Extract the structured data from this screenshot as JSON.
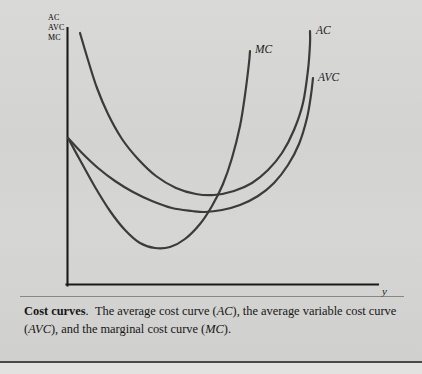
{
  "figure": {
    "axis_origin_labels": [
      "AC",
      "AVC",
      "MC"
    ],
    "x_axis_label": "y",
    "curve_labels": {
      "mc": "MC",
      "ac": "AC",
      "avc": "AVC"
    }
  },
  "caption": {
    "title": "Cost curves",
    "title_punct": ".",
    "text_part_1": "The average cost curve (",
    "ac": "AC",
    "text_part_2": "), the average variable cost curve (",
    "avc": "AVC",
    "text_part_3": "), and the marginal cost curve (",
    "mc": "MC",
    "text_part_4": ")."
  },
  "colors": {
    "background": "#d4d4d2",
    "ink": "#1c1c1c",
    "curve": "#3b3b3b",
    "axis": "#1a1a1a",
    "rule": "#4a4a48"
  },
  "chart_data": {
    "type": "line",
    "title": "Cost curves",
    "xlabel": "y",
    "ylabel": "AC, AVC, MC",
    "grid": false,
    "legend": "inline-curve-labels",
    "axis_origin_px": [
      67,
      285
    ],
    "xlim_px": [
      67,
      378
    ],
    "ylim_px": [
      285,
      28
    ],
    "series": [
      {
        "name": "MC",
        "label": "MC",
        "description": "Marginal cost curve: falls from the vertical axis, reaches a minimum, then rises steeply; it cuts AVC and AC at their minimum points.",
        "points_px": [
          [
            68,
            138
          ],
          [
            80,
            160
          ],
          [
            95,
            187
          ],
          [
            110,
            211
          ],
          [
            125,
            230
          ],
          [
            140,
            243
          ],
          [
            155,
            248
          ],
          [
            170,
            247
          ],
          [
            185,
            239
          ],
          [
            200,
            224
          ],
          [
            212,
            206
          ],
          [
            223,
            184
          ],
          [
            232,
            158
          ],
          [
            240,
            126
          ],
          [
            245,
            95
          ],
          [
            249,
            63
          ],
          [
            250,
            51
          ]
        ],
        "minimum_px": [
          160,
          248
        ]
      },
      {
        "name": "AVC",
        "label": "AVC",
        "description": "Average variable cost curve: starts on the vertical axis at the same height as MC, declines to a minimum, then rises.",
        "points_px": [
          [
            68,
            138
          ],
          [
            82,
            153
          ],
          [
            98,
            168
          ],
          [
            115,
            181
          ],
          [
            133,
            192
          ],
          [
            152,
            201
          ],
          [
            172,
            208
          ],
          [
            192,
            211
          ],
          [
            205,
            212
          ],
          [
            222,
            210
          ],
          [
            240,
            205
          ],
          [
            258,
            196
          ],
          [
            274,
            183
          ],
          [
            288,
            165
          ],
          [
            299,
            144
          ],
          [
            307,
            118
          ],
          [
            311,
            95
          ],
          [
            313,
            78
          ]
        ],
        "minimum_px": [
          205,
          212
        ]
      },
      {
        "name": "AC",
        "label": "AC",
        "description": "Average cost curve: starts very high near the vertical axis, falls steeply, reaches a minimum above and to the right of the AVC minimum, then rises; it lies everywhere above AVC.",
        "points_px": [
          [
            80,
            33
          ],
          [
            88,
            60
          ],
          [
            97,
            88
          ],
          [
            108,
            114
          ],
          [
            122,
            139
          ],
          [
            138,
            159
          ],
          [
            156,
            176
          ],
          [
            176,
            188
          ],
          [
            196,
            194
          ],
          [
            214,
            195
          ],
          [
            234,
            191
          ],
          [
            252,
            183
          ],
          [
            268,
            170
          ],
          [
            282,
            153
          ],
          [
            294,
            130
          ],
          [
            303,
            103
          ],
          [
            308,
            70
          ],
          [
            310,
            44
          ],
          [
            310,
            31
          ]
        ],
        "minimum_px": [
          214,
          195
        ]
      }
    ]
  }
}
